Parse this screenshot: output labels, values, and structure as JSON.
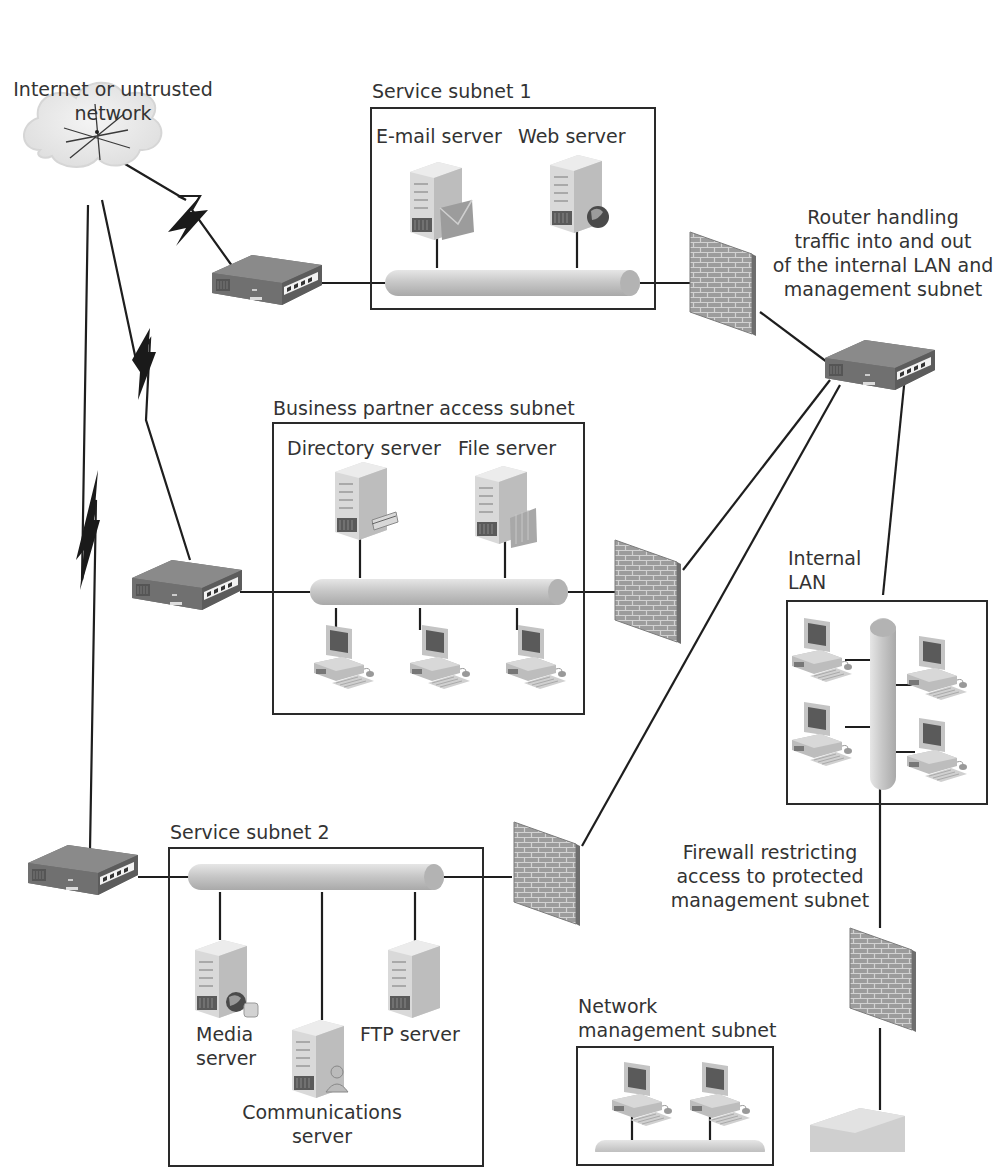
{
  "diagram": {
    "title_fragment": "",
    "colors": {
      "line": "#1e1e1e",
      "device_gray": "#7d7d7d",
      "device_dark": "#5e5e5e",
      "pipe": "#c9c9c9",
      "firewall": "#9a9a9a",
      "cloud": "#ececec",
      "box_border": "#2a2a2a",
      "text": "#333333"
    },
    "labels": {
      "internet": [
        "Internet or untrusted",
        "network"
      ],
      "router_main": [
        "Router handling",
        "traffic into and out",
        "of the internal LAN and",
        "management subnet"
      ],
      "firewall_mgmt": [
        "Firewall restricting",
        "access to protected",
        "management subnet"
      ]
    },
    "subnets": [
      {
        "id": "service-subnet-1",
        "title": "Service subnet 1",
        "servers": [
          {
            "label": "E-mail server",
            "badge": "envelope"
          },
          {
            "label": "Web server",
            "badge": "globe"
          }
        ],
        "workstations": 0
      },
      {
        "id": "business-partner-access-subnet",
        "title": "Business partner access subnet",
        "servers": [
          {
            "label": "Directory server",
            "badge": "directory-card"
          },
          {
            "label": "File server",
            "badge": "folder"
          }
        ],
        "workstations": 3
      },
      {
        "id": "internal-lan",
        "title": [
          "Internal",
          "LAN"
        ],
        "servers": [],
        "workstations": 4
      },
      {
        "id": "service-subnet-2",
        "title": "Service subnet 2",
        "servers": [
          {
            "label": [
              "Media",
              "server"
            ],
            "badge": "globe-disk"
          },
          {
            "label": [
              "Communications",
              "server"
            ],
            "badge": "person"
          },
          {
            "label": "FTP server",
            "badge": "none"
          }
        ],
        "workstations": 0
      },
      {
        "id": "network-management-subnet",
        "title": [
          "Network",
          "management subnet"
        ],
        "servers": [],
        "workstations": 2
      }
    ],
    "devices": {
      "routers": 5,
      "firewalls": 4,
      "clouds": 1
    }
  }
}
